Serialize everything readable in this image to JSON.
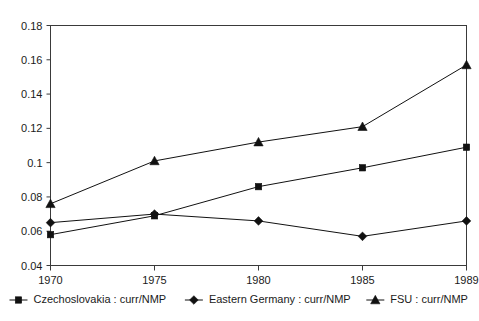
{
  "chart_data": {
    "type": "line",
    "title": "",
    "xlabel": "",
    "ylabel": "",
    "x": [
      1970,
      1975,
      1980,
      1985,
      1989
    ],
    "categories": [
      "1970",
      "1975",
      "1980",
      "1985",
      "1989"
    ],
    "ylim": [
      0.04,
      0.18
    ],
    "yticks": [
      0.04,
      0.06,
      0.08,
      0.1,
      0.12,
      0.14,
      0.16,
      0.18
    ],
    "ytick_labels": [
      "0.04",
      "0.06",
      "0.08",
      "0.1",
      "0.12",
      "0.14",
      "0.16",
      "0.18"
    ],
    "xtick_labels": [
      "1970",
      "1975",
      "1980",
      "1985",
      "1989"
    ],
    "grid": false,
    "legend_position": "bottom",
    "series": [
      {
        "name": "Czechoslovakia : curr/NMP",
        "marker": "square",
        "color": "#111111",
        "values": [
          0.058,
          0.069,
          0.086,
          0.097,
          0.109
        ]
      },
      {
        "name": "Eastern Germany : curr/NMP",
        "marker": "diamond",
        "color": "#111111",
        "values": [
          0.065,
          0.07,
          0.066,
          0.057,
          0.066
        ]
      },
      {
        "name": "FSU : curr/NMP",
        "marker": "triangle",
        "color": "#111111",
        "values": [
          0.076,
          0.101,
          0.112,
          0.121,
          0.157
        ]
      }
    ]
  },
  "legend": {
    "items": [
      {
        "label": "Czechoslovakia : curr/NMP",
        "marker": "square"
      },
      {
        "label": "Eastern Germany : curr/NMP",
        "marker": "diamond"
      },
      {
        "label": "FSU : curr/NMP",
        "marker": "triangle"
      }
    ]
  }
}
